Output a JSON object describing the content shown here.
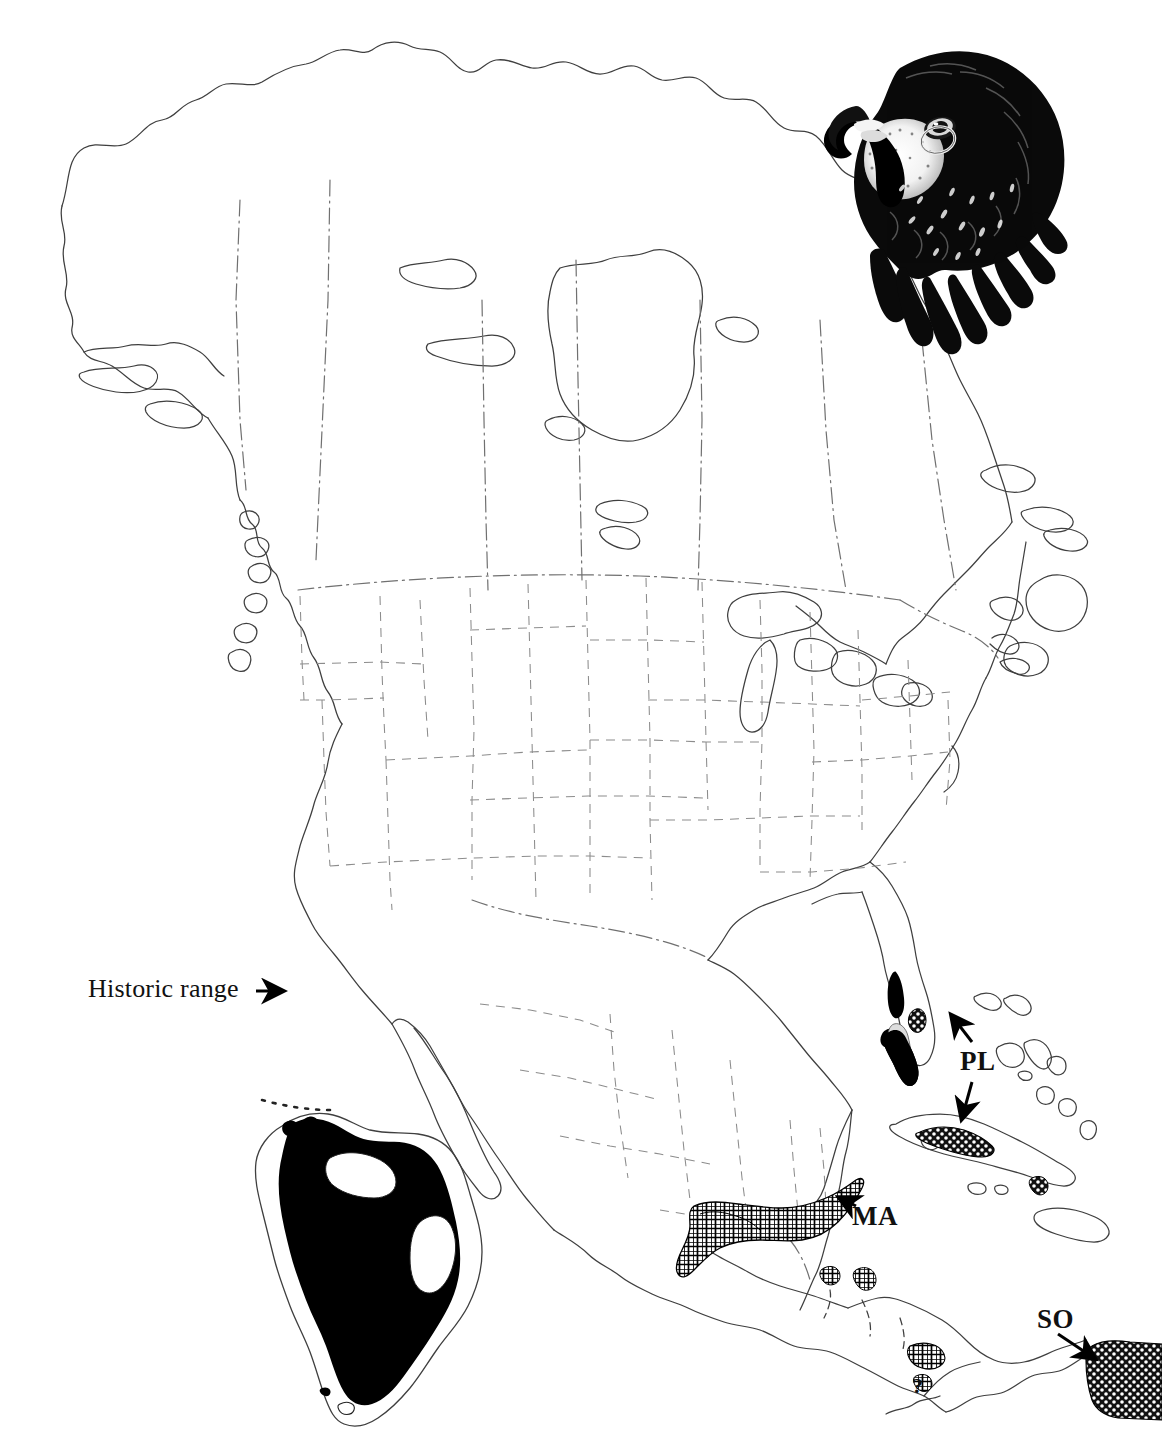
{
  "figure": {
    "kind": "range-map",
    "region": "North America, Central America and Caribbean",
    "background_color": "#ffffff",
    "ink_color": "#000000",
    "coastline_color": "#3a3a3a",
    "border_color": "#6b6b6b"
  },
  "illustration": {
    "name": "peregrine-falcon-head",
    "description": "Pen-and-ink stipple drawing of a dark falcon head in left profile",
    "position": "top-right"
  },
  "labels": {
    "historic_range": "Historic range",
    "pealei": "PL",
    "macropus": "MA",
    "southern": "SO",
    "query": "?"
  },
  "annotations": [
    {
      "name": "historic-range-callout",
      "text": "Historic range",
      "points_to": "peninsular Florida black range",
      "arrow": "right"
    },
    {
      "name": "pl-callout",
      "text": "PL",
      "points_to": "southern Florida and northern Cuba stippled range",
      "arrow": "up-and-down"
    },
    {
      "name": "ma-callout",
      "text": "MA",
      "points_to": "Yucatan / southern Mexico cross-hatched range",
      "arrow": "left"
    },
    {
      "name": "so-callout",
      "text": "SO",
      "points_to": "northern South America stippled range",
      "arrow": "down-right"
    },
    {
      "name": "uncertain-range-marker",
      "text": "?",
      "points_to": "Panama / Darien region",
      "arrow": "none"
    }
  ],
  "legend_patterns": [
    {
      "name": "solid-black-fill",
      "meaning": "historic breeding range",
      "color": "#000000"
    },
    {
      "name": "cross-hatch-fill",
      "meaning": "subspecies range (MA)",
      "color": "#000000"
    },
    {
      "name": "stipple-dot-fill",
      "meaning": "subspecies range (PL, SO)",
      "color": "#000000"
    }
  ],
  "inset": {
    "name": "south-america-inset",
    "description": "South America outline with solid black range fill and two unfilled voids",
    "position": "lower-left"
  },
  "map_features": [
    {
      "name": "coastlines",
      "style": "thin solid line"
    },
    {
      "name": "international-borders",
      "style": "dash-dot line"
    },
    {
      "name": "state-and-province-borders",
      "style": "dashed line"
    },
    {
      "name": "great-lakes",
      "style": "thin solid outline"
    }
  ]
}
